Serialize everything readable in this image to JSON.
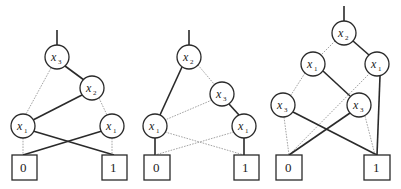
{
  "figure": {
    "edge_styles": {
      "high": "solid",
      "low": "dotted"
    },
    "colors": {
      "stroke": "#2a2a2a",
      "low_edge": "#9a9a9a",
      "background": "#ffffff"
    }
  },
  "diagrams": [
    {
      "id": "bdd-1",
      "nodes": [
        {
          "id": "a",
          "var": "x",
          "sub": "3",
          "cx": 57,
          "cy": 57
        },
        {
          "id": "b",
          "var": "x",
          "sub": "2",
          "cx": 92,
          "cy": 88
        },
        {
          "id": "c",
          "var": "x",
          "sub": "1",
          "cx": 23,
          "cy": 126
        },
        {
          "id": "d",
          "var": "x",
          "sub": "1",
          "cx": 112,
          "cy": 126
        }
      ],
      "terminals": [
        {
          "id": "t0",
          "label": "0",
          "x": 12,
          "y": 155
        },
        {
          "id": "t1",
          "label": "1",
          "x": 102,
          "y": 155
        }
      ]
    },
    {
      "id": "bdd-2",
      "nodes": [
        {
          "id": "a",
          "var": "x",
          "sub": "2",
          "cx": 189,
          "cy": 57
        },
        {
          "id": "b",
          "var": "x",
          "sub": "3",
          "cx": 222,
          "cy": 94
        },
        {
          "id": "c",
          "var": "x",
          "sub": "1",
          "cx": 155,
          "cy": 126
        },
        {
          "id": "d",
          "var": "x",
          "sub": "1",
          "cx": 244,
          "cy": 126
        }
      ],
      "terminals": [
        {
          "id": "t0",
          "label": "0",
          "x": 144,
          "y": 155
        },
        {
          "id": "t1",
          "label": "1",
          "x": 234,
          "y": 155
        }
      ]
    },
    {
      "id": "bdd-3",
      "nodes": [
        {
          "id": "a",
          "var": "x",
          "sub": "2",
          "cx": 344,
          "cy": 33
        },
        {
          "id": "b",
          "var": "x",
          "sub": "1",
          "cx": 313,
          "cy": 64
        },
        {
          "id": "c",
          "var": "x",
          "sub": "1",
          "cx": 377,
          "cy": 64
        },
        {
          "id": "d",
          "var": "x",
          "sub": "3",
          "cx": 283,
          "cy": 105
        },
        {
          "id": "e",
          "var": "x",
          "sub": "3",
          "cx": 359,
          "cy": 105
        }
      ],
      "terminals": [
        {
          "id": "t0",
          "label": "0",
          "x": 276,
          "y": 155
        },
        {
          "id": "t1",
          "label": "1",
          "x": 364,
          "y": 155
        }
      ]
    }
  ]
}
